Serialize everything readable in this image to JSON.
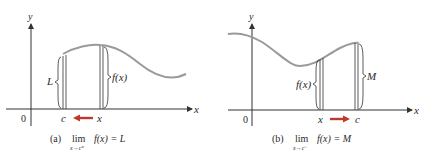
{
  "panels": [
    {
      "id": "a",
      "axis_labels": {
        "x": "x",
        "y": "y",
        "origin": "0"
      },
      "point_labels": {
        "left": "c",
        "right": "x"
      },
      "bracket_labels": {
        "left": "L",
        "right": "f(x)"
      },
      "arrow_direction": "left",
      "caption": {
        "tag": "(a)",
        "lim": "lim",
        "sub": "x→c⁺",
        "expr": "f(x) = L"
      }
    },
    {
      "id": "b",
      "axis_labels": {
        "x": "x",
        "y": "y",
        "origin": "0"
      },
      "point_labels": {
        "left": "x",
        "right": "c"
      },
      "bracket_labels": {
        "left": "f(x)",
        "right": "M"
      },
      "arrow_direction": "right",
      "caption": {
        "tag": "(b)",
        "lim": "lim",
        "sub": "x→c⁻",
        "expr": "f(x) = M"
      }
    }
  ],
  "colors": {
    "curve": "#9a9a9a",
    "axis": "#333333",
    "arrow": "#c0392b",
    "text": "#2a2a2a"
  }
}
